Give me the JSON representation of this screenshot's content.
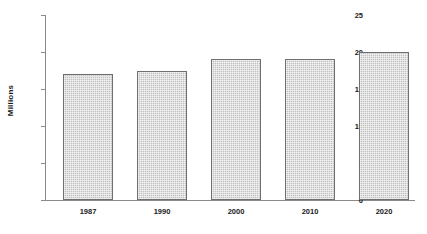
{
  "chart_data": {
    "type": "bar",
    "title": "",
    "xlabel": "",
    "ylabel": "Millions",
    "categories": [
      "1987",
      "1990",
      "2000",
      "2010",
      "2020"
    ],
    "values": [
      17,
      17.5,
      19,
      19.1,
      20
    ],
    "ylim": [
      0,
      25
    ],
    "yticks": [
      0,
      5,
      10,
      15,
      20,
      25
    ],
    "ytick_labels": [
      "0",
      "5",
      "10",
      "15",
      "20",
      "25"
    ],
    "grid": false,
    "legend": null,
    "series": [
      {
        "name": "Millions",
        "values": [
          17,
          17.5,
          19,
          19.1,
          20
        ]
      }
    ],
    "bar_fill_color": "#c2c2c2",
    "bar_border_color": "#6f6f6f",
    "axis_color": "#8a8a8a",
    "text_color": "#1a1a1a",
    "background_color": "#ffffff"
  }
}
